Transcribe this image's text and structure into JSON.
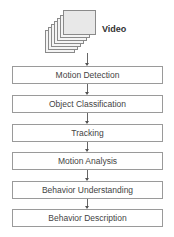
{
  "diagram": {
    "type": "flowchart",
    "input": {
      "label": "Video",
      "icon": "video-frames-stack-icon"
    },
    "steps": [
      {
        "label": "Motion Detection"
      },
      {
        "label": "Object Classification"
      },
      {
        "label": "Tracking"
      },
      {
        "label": "Motion Analysis"
      },
      {
        "label": "Behavior Understanding"
      },
      {
        "label": "Behavior Description"
      }
    ],
    "colors": {
      "border": "#9a9a9a",
      "text": "#444444",
      "frame_fill": "#e8e8e8"
    }
  }
}
